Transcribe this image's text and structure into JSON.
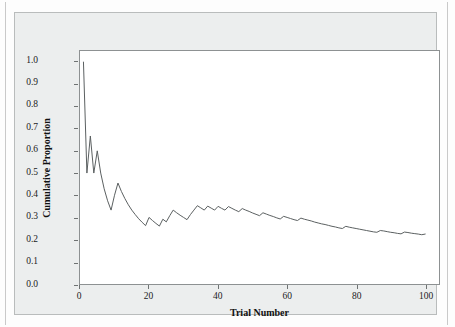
{
  "figure": {
    "background_color": "#eceeee",
    "plot_background_color": "#ffffff",
    "frame_color": "#8d9192",
    "line_color": "#5a5f60"
  },
  "chart_data": {
    "type": "line",
    "title": "",
    "subtitle": "",
    "xlabel": "Trial Number",
    "ylabel": "Cumulative Proportion",
    "xlim": [
      0,
      104
    ],
    "ylim": [
      0.0,
      1.05
    ],
    "xticks": [
      0,
      20,
      40,
      60,
      80,
      100
    ],
    "xtick_labels": [
      "0",
      "20",
      "40",
      "60",
      "80",
      "100"
    ],
    "yticks": [
      0.0,
      0.1,
      0.2,
      0.3,
      0.4,
      0.5,
      0.6,
      0.7,
      0.8,
      0.9,
      1.0
    ],
    "ytick_labels": [
      "0.0",
      "0.1",
      "0.2",
      "0.3",
      "0.4",
      "0.5",
      "0.6",
      "0.7",
      "0.8",
      "0.9",
      "1.0"
    ],
    "grid": false,
    "legend": null,
    "legend_position": "none",
    "series": [
      {
        "name": "Cumulative Proportion",
        "color": "#5a5f60",
        "x": [
          1,
          2,
          3,
          4,
          5,
          6,
          7,
          8,
          9,
          10,
          11,
          12,
          13,
          14,
          15,
          16,
          17,
          18,
          19,
          20,
          21,
          22,
          23,
          24,
          25,
          26,
          27,
          28,
          29,
          30,
          31,
          32,
          33,
          34,
          35,
          36,
          37,
          38,
          39,
          40,
          41,
          42,
          43,
          44,
          45,
          46,
          47,
          48,
          49,
          50,
          51,
          52,
          53,
          54,
          55,
          56,
          57,
          58,
          59,
          60,
          61,
          62,
          63,
          64,
          65,
          66,
          67,
          68,
          69,
          70,
          71,
          72,
          73,
          74,
          75,
          76,
          77,
          78,
          79,
          80,
          81,
          82,
          83,
          84,
          85,
          86,
          87,
          88,
          89,
          90,
          91,
          92,
          93,
          94,
          95,
          96,
          97,
          98,
          99,
          100
        ],
        "y": [
          1.0,
          0.5,
          0.667,
          0.5,
          0.6,
          0.5,
          0.429,
          0.375,
          0.333,
          0.4,
          0.455,
          0.417,
          0.385,
          0.357,
          0.333,
          0.313,
          0.294,
          0.278,
          0.263,
          0.3,
          0.286,
          0.273,
          0.261,
          0.292,
          0.28,
          0.308,
          0.333,
          0.321,
          0.31,
          0.3,
          0.29,
          0.313,
          0.333,
          0.353,
          0.343,
          0.333,
          0.351,
          0.342,
          0.333,
          0.35,
          0.341,
          0.333,
          0.349,
          0.341,
          0.333,
          0.326,
          0.34,
          0.333,
          0.327,
          0.32,
          0.314,
          0.308,
          0.321,
          0.315,
          0.309,
          0.304,
          0.298,
          0.293,
          0.305,
          0.3,
          0.295,
          0.29,
          0.286,
          0.297,
          0.292,
          0.288,
          0.284,
          0.279,
          0.275,
          0.271,
          0.268,
          0.264,
          0.26,
          0.257,
          0.253,
          0.25,
          0.26,
          0.256,
          0.253,
          0.25,
          0.247,
          0.244,
          0.241,
          0.238,
          0.235,
          0.233,
          0.241,
          0.239,
          0.236,
          0.233,
          0.231,
          0.228,
          0.226,
          0.234,
          0.232,
          0.229,
          0.227,
          0.225,
          0.222,
          0.225
        ]
      }
    ]
  },
  "axis": {
    "x_title": "Trial Number",
    "y_title": "Cumulative Proportion"
  }
}
